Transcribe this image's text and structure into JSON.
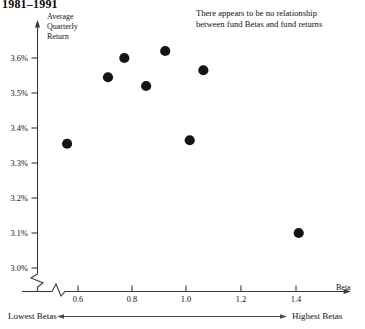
{
  "title": "1981–1991",
  "annotation": "There appears to be no relationship\nbetween fund Betas and fund returns",
  "axes": {
    "y_title": "Average\nQuarterly\nReturn",
    "x_title": "Beta",
    "y_ticks": [
      "3.6%",
      "3.5%",
      "3.4%",
      "3.3%",
      "3.2%",
      "3.1%",
      "3.0%"
    ],
    "x_ticks": [
      "0.6",
      "0.8",
      "1.0",
      "1.2",
      "1.4"
    ],
    "y_break": true,
    "x_break": true
  },
  "footer": {
    "left_label": "Lowest Betas",
    "right_label": "Highest Betas"
  },
  "colors": {
    "marker": "#141414",
    "axis": "#3a3a3a",
    "text": "#111111"
  },
  "chart_data": {
    "type": "scatter",
    "title": "1981–1991",
    "xlabel": "Beta",
    "ylabel": "Average Quarterly Return",
    "xlim": [
      0.5,
      1.55
    ],
    "ylim": [
      2.98,
      3.66
    ],
    "grid": false,
    "legend": null,
    "x_tick_values": [
      0.6,
      0.8,
      1.0,
      1.2,
      1.4
    ],
    "y_tick_values": [
      3.6,
      3.5,
      3.4,
      3.3,
      3.2,
      3.1,
      3.0
    ],
    "y_tick_labels": [
      "3.6%",
      "3.5%",
      "3.4%",
      "3.3%",
      "3.2%",
      "3.1%",
      "3.0%"
    ],
    "points": [
      {
        "x": 0.56,
        "y": 3.355
      },
      {
        "x": 0.71,
        "y": 3.545
      },
      {
        "x": 0.77,
        "y": 3.6
      },
      {
        "x": 0.85,
        "y": 3.52
      },
      {
        "x": 0.92,
        "y": 3.62
      },
      {
        "x": 1.01,
        "y": 3.365
      },
      {
        "x": 1.06,
        "y": 3.565
      },
      {
        "x": 1.41,
        "y": 3.1
      }
    ],
    "annotations": [
      {
        "text": "There appears to be no relationship between fund Betas and fund returns",
        "x": 1.05,
        "y": 3.66
      }
    ]
  }
}
